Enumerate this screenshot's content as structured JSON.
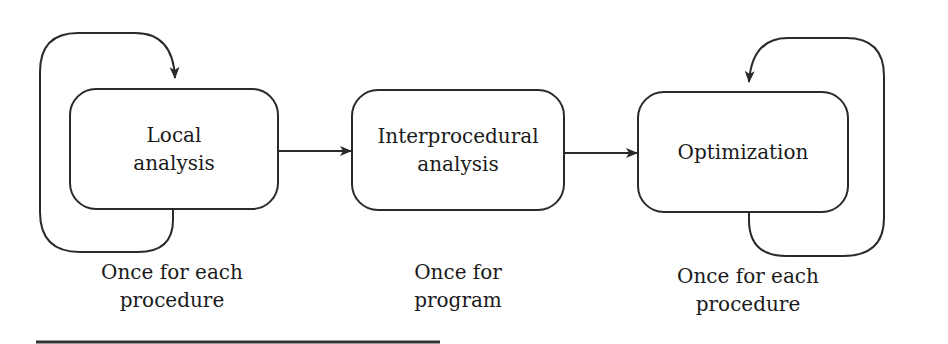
{
  "nodes": [
    {
      "id": "local",
      "lines": [
        "Local",
        "analysis"
      ],
      "caption": [
        "Once for each",
        "procedure"
      ],
      "self_loop": "left"
    },
    {
      "id": "interprocedural",
      "lines": [
        "Interprocedural",
        "analysis"
      ],
      "caption": [
        "Once for",
        "program"
      ],
      "self_loop": "none"
    },
    {
      "id": "optimization",
      "lines": [
        "Optimization"
      ],
      "caption": [
        "Once for each",
        "procedure"
      ],
      "self_loop": "right"
    }
  ],
  "edges": [
    {
      "from": "local",
      "to": "interprocedural"
    },
    {
      "from": "interprocedural",
      "to": "optimization"
    }
  ],
  "colors": {
    "stroke": "#2a2a2a",
    "text": "#1a1a1a",
    "background": "#ffffff"
  }
}
